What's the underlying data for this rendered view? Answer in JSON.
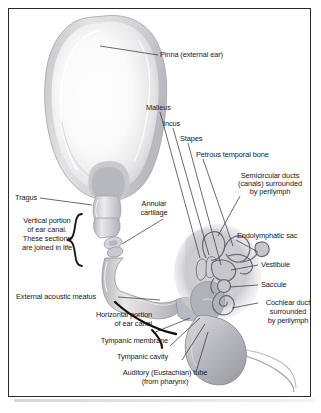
{
  "figure": {
    "frame_color": "#2a2a2e",
    "background_color": "#ffffff",
    "text_color": "#18181c"
  },
  "labels": {
    "pinna": "Pinna (external ear)",
    "malleus": "Malleus",
    "incus": "Incus",
    "stapes": "Stapes",
    "petrous_temporal_bone": "Petrous temporal bone",
    "semicircular_ducts_l1": "Semicircular ducts",
    "semicircular_ducts_l2": "(canals) surrounded",
    "semicircular_ducts_l3": "by perilymph",
    "tragus": "Tragus",
    "annular_l1": "Annular",
    "annular_l2": "cartilage",
    "endolymphatic_sac": "Endolymphatic sac",
    "vertical_portion_l1": "Vertical portion",
    "vertical_portion_l2": "of ear canal.",
    "vertical_portion_l3": "These sections",
    "vertical_portion_l4": "are joined in life",
    "vestibule": "Vestibule",
    "saccule": "Saccule",
    "external_acoustic_meatus": "External acoustic meatus",
    "cochlear_duct_l1": "Cochlear duct",
    "cochlear_duct_l2": "surrounded",
    "cochlear_duct_l3": "by perilymph",
    "horizontal_portion_l1": "Horizontal portion",
    "horizontal_portion_l2": "of ear canal",
    "tympanic_membrane": "Tympanic membrane",
    "tympanic_cavity": "Tympanic cavity",
    "auditory_tube_l1": "Auditory (Eustachian) tube",
    "auditory_tube_l2": "(from pharynx)"
  },
  "icons": {
    "brace": "curly-brace",
    "leader": "leader-line"
  }
}
